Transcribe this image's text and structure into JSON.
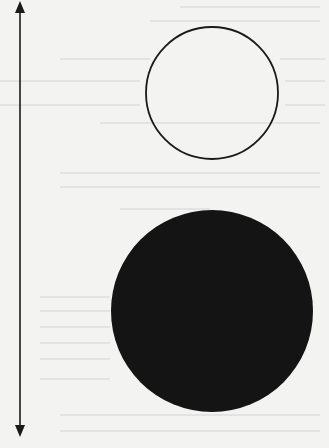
{
  "diagram": {
    "arrow": {
      "x": 20,
      "y_top": 2,
      "y_bottom": 436,
      "color": "#1a1a1a",
      "direction": "both"
    },
    "small_circle": {
      "cx": 212,
      "cy": 93,
      "r": 66,
      "fill": "none",
      "stroke": "#1a1a1a"
    },
    "large_circle": {
      "cx": 212,
      "cy": 311,
      "r": 101,
      "fill": "#141414"
    },
    "background_color": "#f3f3f1"
  }
}
